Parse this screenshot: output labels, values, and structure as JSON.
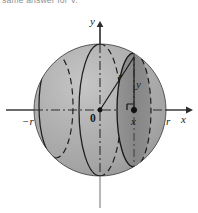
{
  "figure": {
    "caption_fragment": "same answer for V.",
    "background_color": "#ffffff"
  },
  "colors": {
    "sphere_fill": "#adadad",
    "sphere_shadow": "#9b9b9b",
    "sphere_highlight": "#c2c2c2",
    "disk_fill": "#8a8a8a",
    "outline": "#1a1a1a",
    "axis": "#2b2b2b",
    "axis_tail": "#b5b5b5",
    "label": "#1a1a1a"
  },
  "axes": {
    "x_axis": {
      "name": "x-axis",
      "label": "x",
      "label_left_px": 181,
      "label_top_px": 114,
      "y_px": 110,
      "x_start_px": 6,
      "x_end_px": 192,
      "arrow": "right"
    },
    "y_axis": {
      "name": "y-axis",
      "label": "y",
      "label_left_px": 90,
      "label_top_px": 16,
      "x_px": 100,
      "y_start_px": 208,
      "y_end_px": 24,
      "arrow": "up"
    }
  },
  "tick_labels": [
    {
      "id": "neg-r",
      "text": "−r",
      "left_px": 22,
      "top_px": 116,
      "italic": true
    },
    {
      "id": "origin",
      "text": "0",
      "left_px": 90,
      "top_px": 114,
      "italic": false
    },
    {
      "id": "pos-r",
      "text": "r",
      "left_px": 166,
      "top_px": 116,
      "italic": true
    }
  ],
  "annotations": [
    {
      "id": "radius",
      "text": "r",
      "left_px": 118,
      "top_px": 72,
      "italic": true
    },
    {
      "id": "height-y",
      "text": "y",
      "left_px": 134,
      "top_px": 80,
      "italic": true
    },
    {
      "id": "abscissa-x",
      "text": "x",
      "left_px": 134,
      "top_px": 117,
      "italic": true
    }
  ],
  "geometry": {
    "sphere": {
      "center_x_px": 100,
      "center_y_px": 110,
      "radius_px": 66
    },
    "cross_section_disk": {
      "name": "shaded-cross-section-disk",
      "center_x_px": 134,
      "semi_axis_x_px": 17,
      "semi_axis_y_px": 57,
      "style": "filled-dark"
    },
    "left_cross_section": {
      "name": "left-cross-section-ellipse",
      "center_x_px": 56,
      "semi_axis_x_px": 17,
      "semi_axis_y_px": 52,
      "style": "outline-half-dashed"
    },
    "center_cross_section": {
      "name": "center-great-circle-ellipse",
      "center_x_px": 100,
      "semi_axis_x_px": 21,
      "semi_axis_y_px": 66,
      "style": "outline-half-dashed"
    },
    "radius_segment": {
      "name": "radius-line",
      "from": [
        100,
        110
      ],
      "to": [
        134,
        57
      ]
    },
    "height_segment": {
      "name": "y-height-line",
      "from": [
        134,
        110
      ],
      "to": [
        134,
        57
      ]
    },
    "right_angle_marker": {
      "name": "right-angle-marker",
      "left_px": 127,
      "top_px": 103,
      "size_px": 6
    },
    "point_marker": {
      "name": "point-on-axis-dot",
      "cx_px": 134,
      "cy_px": 110,
      "r_px": 3
    },
    "origin_marker": {
      "name": "origin-dot",
      "cx_px": 100,
      "cy_px": 110,
      "r_px": 2.6
    }
  }
}
